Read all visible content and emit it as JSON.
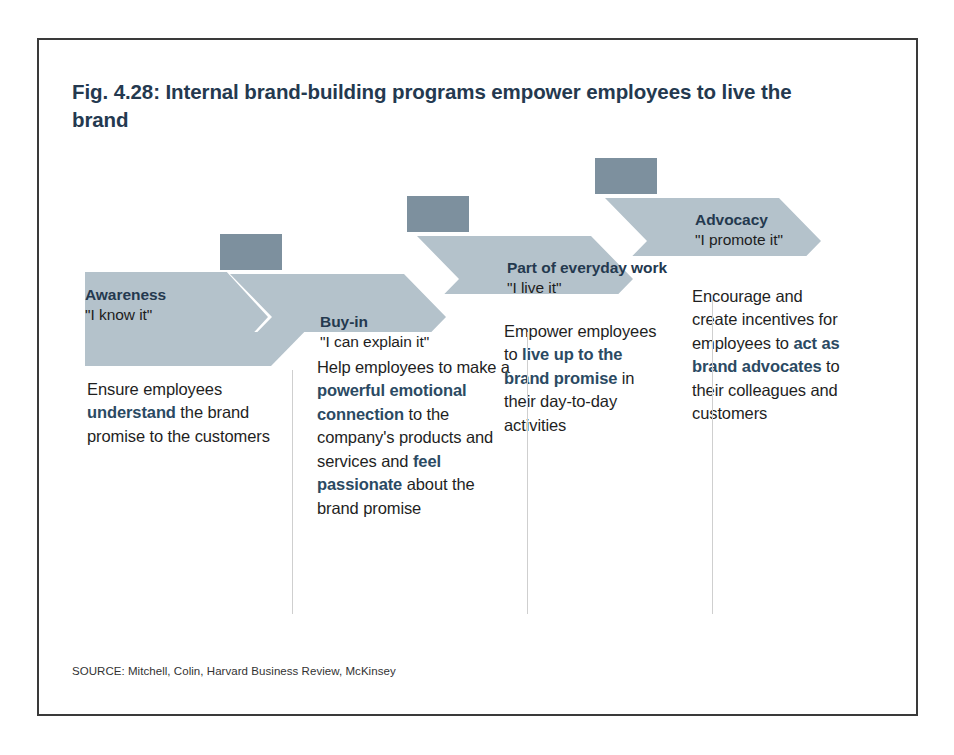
{
  "figure": {
    "title": "Fig. 4.28: Internal brand-building programs empower employees to live the brand",
    "source": "SOURCE: Mitchell, Colin, Harvard Business Review, McKinsey",
    "border_color": "#3a3a3a",
    "title_color": "#24394f"
  },
  "colors": {
    "arrow_fill": "#b4c2cb",
    "arrow_shadow": "#7d909e",
    "arrow_notch": "#ffffff",
    "heading_text": "#24394f",
    "quote_text": "#1d1d1d",
    "body_text": "#1f1f1f",
    "body_bold": "#2b4a63",
    "divider": "#cfcfcf"
  },
  "stages": [
    {
      "id": "awareness",
      "title": "Awareness",
      "quote": "\"I know it\"",
      "body_html": "Ensure employees <b>understand</b> the brand promise to the customers",
      "body_plain": "Ensure employees understand the brand promise to the customers"
    },
    {
      "id": "buy-in",
      "title": "Buy-in",
      "quote": "\"I can explain it\"",
      "body_html": "Help employees to make a <b>powerful emotional connection</b> to the company's products and services and <b>feel passionate</b> about the brand promise",
      "body_plain": "Help employees to make a powerful emotional connection to the company's products and services and feel passionate about the brand promise"
    },
    {
      "id": "part-of-everyday-work",
      "title": "Part of everyday work",
      "quote": "\"I live it\"",
      "body_html": "Empower employees to <b>live up to the brand promise</b> in their day-to-day activities",
      "body_plain": "Empower employees to live up to the brand promise in their day-to-day activities"
    },
    {
      "id": "advocacy",
      "title": "Advocacy",
      "quote": "\"I promote it\"",
      "body_html": "Encourage and create incentives for employees to <b>act as brand advocates</b> to their colleagues and customers",
      "body_plain": "Encourage and create incentives for employees to act as brand advocates to their colleagues and customers"
    }
  ]
}
